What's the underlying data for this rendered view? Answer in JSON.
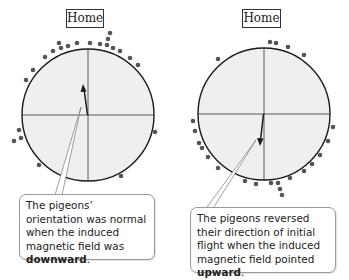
{
  "colors": {
    "circle_fill": "#efefef",
    "circle_stroke": "#1a1a1a",
    "dot": "#555555",
    "arrow": "#1a1a1a"
  },
  "panels": [
    {
      "home_label": "Home",
      "callout": {
        "text_before": "The pigeons’ orientation was normal when the induced magnetic field was ",
        "emphasis": "downward",
        "text_after": "."
      },
      "mean_vector": {
        "direction": "up",
        "description": "Mean orientation toward home"
      }
    },
    {
      "home_label": "Home",
      "callout": {
        "text_before": "The pigeons reversed their direction of initial flight when the induced magnetic field pointed ",
        "emphasis": "upward",
        "text_after": "."
      },
      "mean_vector": {
        "direction": "down",
        "description": "Mean orientation away from home"
      }
    }
  ]
}
